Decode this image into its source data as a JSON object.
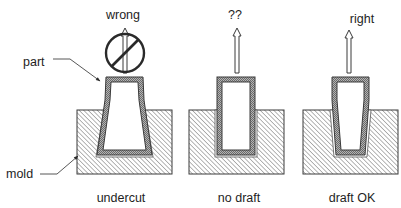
{
  "figure": {
    "callouts": {
      "part": "part",
      "mold": "mold"
    },
    "panels": [
      {
        "id": "undercut",
        "annotation": "wrong",
        "caption": "undercut",
        "icon": "prohibited-icon"
      },
      {
        "id": "no-draft",
        "annotation": "??",
        "caption": "no draft",
        "icon": "hollow-up-arrow-icon"
      },
      {
        "id": "draft-ok",
        "annotation": "right",
        "caption": "draft OK",
        "icon": "hollow-up-arrow-icon"
      }
    ]
  },
  "colors": {
    "background": "#ffffff",
    "line": "#3a3a3a",
    "hatch": "#6e6e6e",
    "part_fill": "#8c8c8c",
    "text": "#1e1e1e"
  }
}
